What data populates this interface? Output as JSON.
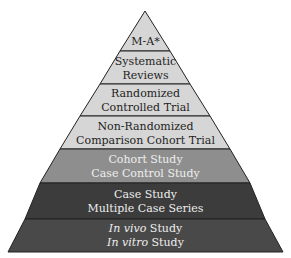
{
  "pyramid": {
    "levels": [
      {
        "line1": "M-A*",
        "line2": ""
      },
      {
        "line1": "Systematic",
        "line2": "Reviews"
      },
      {
        "line1": "Randomized",
        "line2": "Controlled Trial"
      },
      {
        "line1": "Non-Randomized",
        "line2": "Comparison Cohort Trial"
      },
      {
        "line1": "Cohort Study",
        "line2": "Case Control Study"
      },
      {
        "line1": "Case Study",
        "line2": "Multiple Case Series"
      },
      {
        "line1_italic": "In vivo",
        "line1_rest": " Study",
        "line2_italic": "In vitro",
        "line2_rest": " Study"
      }
    ],
    "colors": {
      "top": "#d6d6d6",
      "cohort": "#8e8e8e",
      "case": "#3c3c3c",
      "invivo": "#494949",
      "outline": "#222222"
    }
  }
}
